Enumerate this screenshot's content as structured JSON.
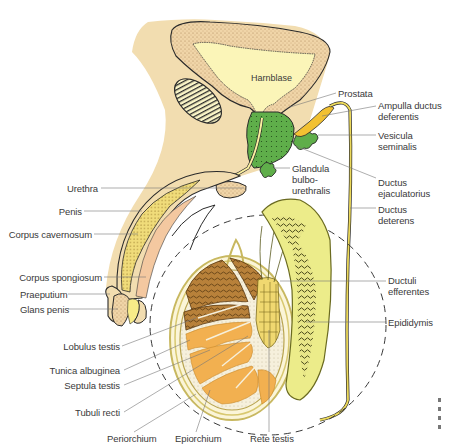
{
  "figure": {
    "type": "anatomical-diagram",
    "colors": {
      "skin": "#f2ddb0",
      "dotted_tissue": "#f0d5a8",
      "bladder_lumen": "#fbf5b8",
      "prostate_green": "#5fae4a",
      "ampulla_yellow": "#f2c132",
      "ductus_yellow": "#ecd95a",
      "lobule_brown": "#b8813a",
      "lobule_orange": "#f2b050",
      "epididymis_yellow": "#ecec8a",
      "outline": "#2a2a2a",
      "label_text": "#3a3a3a",
      "leader_line": "#777777"
    }
  },
  "labels": {
    "harnblase": "Harnblase",
    "prostata": "Prostata",
    "ampulla": "Ampulla ductus\ndeferentis",
    "vesicula": "Vesicula\nseminalis",
    "glandula": "Glandula\nbulbo-\nurethralis",
    "ductus_ejac": "Ductus\nejaculatorius",
    "urethra": "Urethra",
    "ductus_def": "Ductus\ndeterens",
    "penis": "Penis",
    "corpus_cav": "Corpus cavernosum",
    "corpus_spong": "Corpus spongiosum",
    "praeputium": "Praeputium",
    "glans": "Glans penis",
    "ductuli": "Ductuli\nefferentes",
    "epididymis": "Epididymis",
    "lobulus": "Lobulus testis",
    "tunica": "Tunica albuginea",
    "septula": "Septula testis",
    "tubuli": "Tubuli recti",
    "periorchium": "Periorchium",
    "epiorchium": "Epiorchium",
    "rete": "Rete testis"
  }
}
